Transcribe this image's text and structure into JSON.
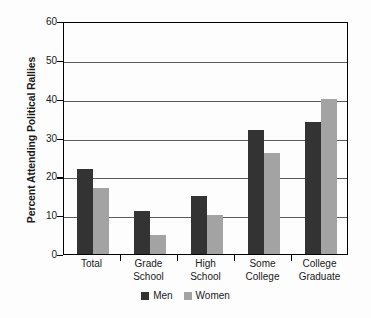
{
  "chart_data": {
    "type": "bar",
    "title": "",
    "xlabel": "",
    "ylabel": "Percent Attending Political Rallies",
    "ylim": [
      0,
      60
    ],
    "yticks": [
      0,
      10,
      20,
      30,
      40,
      50,
      60
    ],
    "ytick_labels": [
      "0",
      "10",
      "20",
      "30",
      "40",
      "50",
      "60"
    ],
    "grid": true,
    "legend_position": "bottom-center",
    "categories": [
      "Total",
      "Grade School",
      "High School",
      "Some College",
      "College Graduate"
    ],
    "category_lines": [
      [
        "Total"
      ],
      [
        "Grade",
        "School"
      ],
      [
        "High",
        "School"
      ],
      [
        "Some",
        "College"
      ],
      [
        "College",
        "Graduate"
      ]
    ],
    "series": [
      {
        "name": "Men",
        "color": "#333333",
        "values": [
          22,
          11,
          15,
          32,
          34
        ]
      },
      {
        "name": "Women",
        "color": "#a3a3a3",
        "values": [
          17,
          5,
          10,
          26,
          40
        ]
      }
    ]
  },
  "legend": {
    "items": [
      {
        "label": "Men",
        "color": "#333333"
      },
      {
        "label": "Women",
        "color": "#a3a3a3"
      }
    ]
  },
  "colors": {
    "men": "#333333",
    "women": "#a3a3a3",
    "axis": "#000000",
    "gridline": "#5a5a5a",
    "background": "#fdfdfd",
    "text": "#1a1a1a"
  }
}
